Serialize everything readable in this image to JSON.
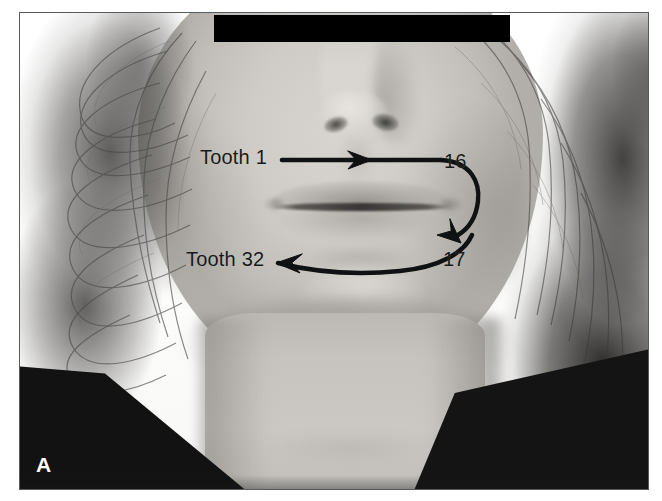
{
  "figure": {
    "panel_label": "A",
    "type": "clinical photograph with dental-numbering annotation",
    "color_mode": "grayscale"
  },
  "annotations": {
    "tooth_start_upper": "Tooth 1",
    "upper_end": "16",
    "lower_start": "17",
    "tooth_end_lower": "Tooth 32"
  },
  "arrows": [
    {
      "name": "upper-arch-arrow",
      "from": "Tooth 1",
      "to": "16",
      "direction": "left-to-right",
      "arrowhead": "mid-line-right"
    },
    {
      "name": "right-side-connector-arrow",
      "from": "16",
      "to": "17",
      "direction": "curving-downward",
      "arrowhead": "bottom-right-down"
    },
    {
      "name": "lower-arch-arrow",
      "from": "17",
      "to": "Tooth 32",
      "direction": "right-to-left",
      "arrowhead": "left-end"
    }
  ],
  "redaction": {
    "name": "eye-redaction-bar",
    "color": "#000000",
    "purpose": "patient identity masking"
  },
  "colors": {
    "annotation_ink": "#17191a",
    "panel_letter": "#ffffff",
    "frame_border": "#555b5e",
    "page_background": "#ffffff",
    "redaction_bar": "#000000"
  }
}
